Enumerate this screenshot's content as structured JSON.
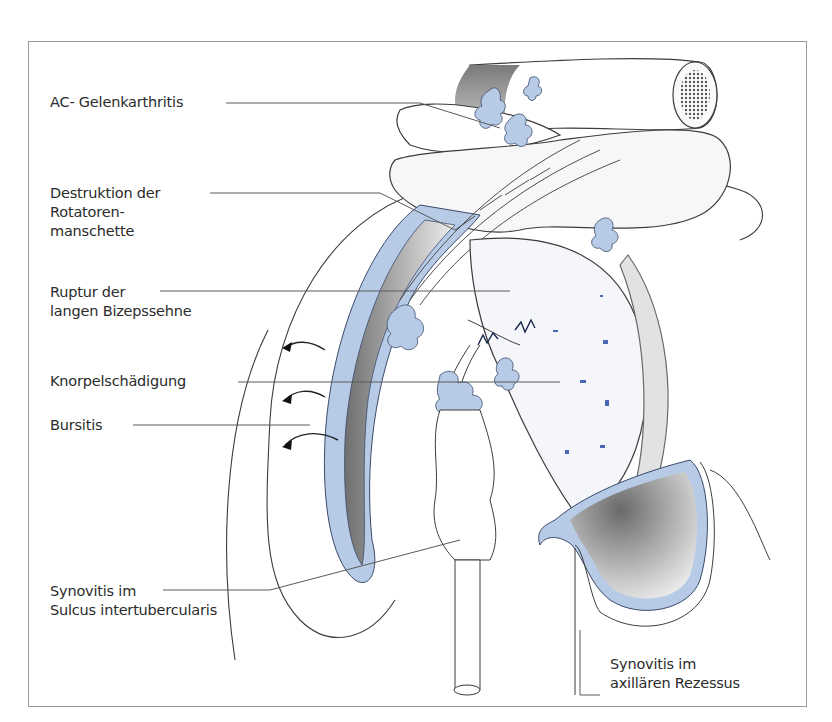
{
  "figure": {
    "colors": {
      "synovitis_fill": "#b8cbe6",
      "synovitis_edge": "#3a4a6a",
      "outline": "#3c3c3c",
      "leader_line": "#5a5a5a",
      "shadow_gray": "#8a8a8a",
      "frame": "#9a9a9a"
    },
    "labels": [
      {
        "id": "ac-joint",
        "lines": [
          "AC- Gelenkarthritis"
        ]
      },
      {
        "id": "rotator-cuff",
        "lines": [
          "Destruktion der",
          "Rotatoren-",
          "manschette"
        ]
      },
      {
        "id": "biceps-rupture",
        "lines": [
          "Ruptur der",
          "langen Bizepssehne"
        ]
      },
      {
        "id": "cartilage",
        "lines": [
          "Knorpelschädigung"
        ]
      },
      {
        "id": "bursitis",
        "lines": [
          "Bursitis"
        ]
      },
      {
        "id": "synovitis-sulcus",
        "lines": [
          "Synovitis im",
          "Sulcus intertubercularis"
        ]
      },
      {
        "id": "synovitis-axillary",
        "lines": [
          "Synovitis im",
          "axillären Rezessus"
        ]
      }
    ]
  }
}
